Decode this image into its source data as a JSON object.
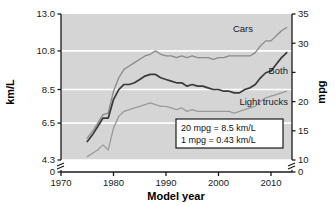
{
  "chart_data": {
    "type": "line",
    "title": "",
    "xlabel": "Model year",
    "ylabel": "km/L",
    "ylabel_right": "mpg",
    "xlim": [
      1970,
      2014
    ],
    "ylim": [
      4.3,
      13.0
    ],
    "ylim_right": [
      10,
      35
    ],
    "grid": true,
    "grid_orientation": "horizontal",
    "legend": "inline-annotations",
    "axis_break_left": true,
    "axis_break_right": true,
    "xticks": [
      1970,
      1980,
      1990,
      2000,
      2010
    ],
    "xtick_labels": [
      "1970",
      "1980",
      "1990",
      "2000",
      "2010"
    ],
    "yticks_left": [
      0,
      4.3,
      6.5,
      8.5,
      10.8,
      13.0
    ],
    "ytick_labels_left": [
      "0",
      "4.3",
      "6.5",
      "8.5",
      "10.8",
      "13.0"
    ],
    "yticks_right": [
      0,
      10,
      15,
      20,
      25,
      30,
      35
    ],
    "ytick_labels_right": [
      "0",
      "10",
      "15",
      "20",
      "25",
      "30",
      "35"
    ],
    "ytick_labels_right_hidden": [
      "25"
    ],
    "series": [
      {
        "name": "Cars",
        "color": "#8a8a8a",
        "x": [
          1975,
          1976,
          1977,
          1978,
          1979,
          1980,
          1981,
          1982,
          1983,
          1984,
          1985,
          1986,
          1987,
          1988,
          1989,
          1990,
          1991,
          1992,
          1993,
          1994,
          1995,
          1996,
          1997,
          1998,
          1999,
          2000,
          2001,
          2002,
          2003,
          2004,
          2005,
          2006,
          2007,
          2008,
          2009,
          2010,
          2011,
          2012,
          2013
        ],
        "values": [
          5.6,
          6.0,
          6.5,
          7.0,
          7.1,
          8.4,
          9.2,
          9.7,
          9.9,
          10.1,
          10.3,
          10.5,
          10.6,
          10.8,
          10.6,
          10.5,
          10.5,
          10.4,
          10.5,
          10.4,
          10.5,
          10.4,
          10.4,
          10.4,
          10.3,
          10.4,
          10.4,
          10.5,
          10.5,
          10.5,
          10.5,
          10.5,
          10.7,
          11.1,
          11.4,
          11.4,
          11.7,
          12.0,
          12.2
        ]
      },
      {
        "name": "Both",
        "color": "#3a3a3a",
        "x": [
          1975,
          1976,
          1977,
          1978,
          1979,
          1980,
          1981,
          1982,
          1983,
          1984,
          1985,
          1986,
          1987,
          1988,
          1989,
          1990,
          1991,
          1992,
          1993,
          1994,
          1995,
          1996,
          1997,
          1998,
          1999,
          2000,
          2001,
          2002,
          2003,
          2004,
          2005,
          2006,
          2007,
          2008,
          2009,
          2010,
          2011,
          2012,
          2013
        ],
        "values": [
          5.4,
          5.8,
          6.3,
          6.8,
          6.8,
          7.9,
          8.5,
          8.8,
          8.8,
          8.9,
          9.1,
          9.3,
          9.4,
          9.4,
          9.2,
          9.1,
          9.0,
          8.9,
          8.9,
          8.7,
          8.8,
          8.7,
          8.7,
          8.6,
          8.5,
          8.5,
          8.4,
          8.4,
          8.3,
          8.3,
          8.5,
          8.6,
          8.8,
          9.2,
          9.5,
          9.6,
          10.0,
          10.4,
          10.7
        ]
      },
      {
        "name": "Light trucks",
        "color": "#9a9a9a",
        "x": [
          1975,
          1976,
          1977,
          1978,
          1979,
          1980,
          1981,
          1982,
          1983,
          1984,
          1985,
          1986,
          1987,
          1988,
          1989,
          1990,
          1991,
          1992,
          1993,
          1994,
          1995,
          1996,
          1997,
          1998,
          1999,
          2000,
          2001,
          2002,
          2003,
          2004,
          2005,
          2006,
          2007,
          2008,
          2009,
          2010,
          2011,
          2012,
          2013
        ],
        "values": [
          4.5,
          4.7,
          4.9,
          5.2,
          4.9,
          6.2,
          6.9,
          7.2,
          7.3,
          7.4,
          7.5,
          7.6,
          7.7,
          7.6,
          7.5,
          7.5,
          7.4,
          7.3,
          7.4,
          7.2,
          7.3,
          7.2,
          7.2,
          7.2,
          7.2,
          7.2,
          7.2,
          7.2,
          7.1,
          7.2,
          7.3,
          7.4,
          7.5,
          7.8,
          8.0,
          8.1,
          8.2,
          8.3,
          8.4
        ]
      }
    ],
    "annotations": [
      {
        "name": "cars-label",
        "text": "Cars"
      },
      {
        "name": "both-label",
        "text": "Both"
      },
      {
        "name": "light-trucks-label",
        "text": "Light trucks"
      }
    ],
    "note_box": {
      "line1": "20 mpg = 8.5 km/L",
      "line2": "1 mpg = 0.43 km/L"
    },
    "colors": {
      "plot_background": "#d5d5d5",
      "gridline": "#ffffff",
      "axis": "#1a1a1a",
      "page_background": "#ffffff"
    }
  }
}
